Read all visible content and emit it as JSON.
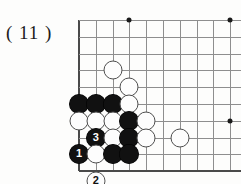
{
  "figure": {
    "label": "( 11 )",
    "caption_name": "figure-number"
  },
  "board": {
    "title": "go-board-corner-diagram",
    "geometry": {
      "origin_x": 79,
      "origin_y": 20,
      "spacing": 16.8,
      "cols": 10,
      "rows": 10,
      "left_edge_col": 0,
      "bottom_edge_row": 9
    },
    "colors": {
      "grid": "#8e8e8e",
      "edge": "#4a4a4a",
      "black_stone": "#111111",
      "white_stone": "#fdfdfd",
      "white_outline": "#4e4e4e",
      "background": "#fdfdfc",
      "label_text": "#1b1b1b"
    },
    "star_points": [
      {
        "col": 3,
        "row": 0,
        "name": "star-point-top"
      },
      {
        "col": 9,
        "row": 0,
        "name": "star-point-top-right"
      },
      {
        "col": 9,
        "row": 6,
        "name": "star-point-right"
      }
    ],
    "stones": [
      {
        "col": 2,
        "row": 3,
        "color": "white",
        "label": "",
        "name": "white-stone-c2r3"
      },
      {
        "col": 3,
        "row": 4,
        "color": "white",
        "label": "",
        "name": "white-stone-c3r4"
      },
      {
        "col": 0,
        "row": 5,
        "color": "black",
        "label": "",
        "name": "black-stone-c0r5"
      },
      {
        "col": 1,
        "row": 5,
        "color": "black",
        "label": "",
        "name": "black-stone-c1r5"
      },
      {
        "col": 2,
        "row": 5,
        "color": "black",
        "label": "",
        "name": "black-stone-c2r5"
      },
      {
        "col": 3,
        "row": 5,
        "color": "white",
        "label": "",
        "name": "white-stone-c3r5"
      },
      {
        "col": 0,
        "row": 6,
        "color": "white",
        "label": "",
        "name": "white-stone-c0r6"
      },
      {
        "col": 1,
        "row": 6,
        "color": "white",
        "label": "",
        "name": "white-stone-c1r6"
      },
      {
        "col": 2,
        "row": 6,
        "color": "white",
        "label": "",
        "name": "white-stone-c2r6"
      },
      {
        "col": 3,
        "row": 6,
        "color": "black",
        "label": "",
        "name": "black-stone-c3r6"
      },
      {
        "col": 4,
        "row": 6,
        "color": "white",
        "label": "",
        "name": "white-stone-c4r6"
      },
      {
        "col": 1,
        "row": 7,
        "color": "black",
        "label": "3",
        "name": "black-move-3"
      },
      {
        "col": 2,
        "row": 7,
        "color": "white",
        "label": "",
        "name": "white-stone-c2r7"
      },
      {
        "col": 3,
        "row": 7,
        "color": "black",
        "label": "",
        "name": "black-stone-c3r7"
      },
      {
        "col": 4,
        "row": 7,
        "color": "white",
        "label": "",
        "name": "white-stone-c4r7"
      },
      {
        "col": 6,
        "row": 7,
        "color": "white",
        "label": "",
        "name": "white-stone-c6r7"
      },
      {
        "col": 0,
        "row": 8,
        "color": "black",
        "label": "1",
        "name": "black-move-1"
      },
      {
        "col": 1,
        "row": 8,
        "color": "white",
        "label": "",
        "name": "white-stone-c1r8"
      },
      {
        "col": 2,
        "row": 8,
        "color": "black",
        "label": "",
        "name": "black-stone-c2r8"
      },
      {
        "col": 3,
        "row": 8,
        "color": "black",
        "label": "",
        "name": "black-stone-c3r8"
      },
      {
        "col": 1,
        "row": 9.6,
        "color": "white",
        "label": "2",
        "name": "white-move-2-offboard"
      }
    ]
  }
}
